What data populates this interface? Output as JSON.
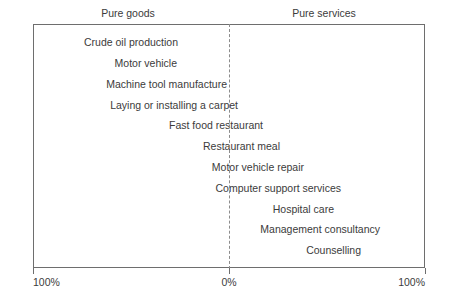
{
  "chart_data": {
    "type": "bar",
    "title": "",
    "subtitle": "",
    "xlabel": "",
    "ylabel": "",
    "orientation": "horizontal",
    "grid": false,
    "legend_position": "none",
    "axis": {
      "left_pole": "Pure goods",
      "right_pole": "Pure services",
      "tick_labels": [
        "100%",
        "0%",
        "100%"
      ],
      "tick_positions_pct": [
        -100,
        0,
        100
      ],
      "xlim": [
        -100,
        100
      ],
      "center_value": 0,
      "center_style": "dashed"
    },
    "categories": [
      "Crude oil production",
      "Motor vehicle",
      "Machine tool manufacture",
      "Laying or installing a carpet",
      "Fast food restaurant",
      "Restaurant meal",
      "Motor vehicle repair",
      "Computer support services",
      "Hospital care",
      "Management consultancy",
      "Counselling"
    ],
    "values": [
      -75,
      -70,
      -50,
      -40,
      -22,
      -10,
      5,
      15,
      35,
      45,
      62
    ],
    "annotations": [
      "Label right edge indicates the goods/services mix position for each offering."
    ]
  },
  "header": {
    "poles": [
      {
        "name": "pure-goods",
        "label": "Pure goods",
        "x": 128
      },
      {
        "name": "pure-services",
        "label": "Pure services",
        "x": 324
      }
    ]
  },
  "plot": {
    "items": [
      {
        "name": "crude-oil-production",
        "label": "Crude oil production",
        "right": 179,
        "y": 35
      },
      {
        "name": "motor-vehicle",
        "label": "Motor vehicle",
        "right": 178,
        "y": 56
      },
      {
        "name": "machine-tool-manufacture",
        "label": "Machine tool manufacture",
        "right": 228,
        "y": 77
      },
      {
        "name": "laying-or-installing-carpet",
        "label": "Laying or installing a carpet",
        "right": 239,
        "y": 98
      },
      {
        "name": "fast-food-restaurant",
        "label": "Fast food restaurant",
        "right": 264,
        "y": 118
      },
      {
        "name": "restaurant-meal",
        "label": "Restaurant meal",
        "right": 281,
        "y": 139
      },
      {
        "name": "motor-vehicle-repair",
        "label": "Motor vehicle repair",
        "right": 305,
        "y": 160
      },
      {
        "name": "computer-support-services",
        "label": "Computer support services",
        "right": 342,
        "y": 181
      },
      {
        "name": "hospital-care",
        "label": "Hospital care",
        "right": 335,
        "y": 202
      },
      {
        "name": "management-consultancy",
        "label": "Management consultancy",
        "right": 381,
        "y": 222
      },
      {
        "name": "counselling",
        "label": "Counselling",
        "right": 362,
        "y": 243
      }
    ]
  },
  "axis": {
    "ticks": [
      {
        "name": "tick-left-100",
        "label": "100%",
        "x": 33,
        "align": "left-end"
      },
      {
        "name": "tick-center-0",
        "label": "0%",
        "x": 229,
        "align": "center"
      },
      {
        "name": "tick-right-100",
        "label": "100%",
        "x": 425,
        "align": "right-end"
      }
    ]
  },
  "colors": {
    "background": "#ffffff",
    "text": "#3b3b3b",
    "frame": "#6e6e6e",
    "midline": "#8c8c8c"
  }
}
